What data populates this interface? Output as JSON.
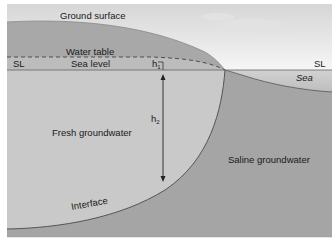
{
  "diagram": {
    "labels": {
      "ground_surface": "Ground surface",
      "water_table": "Water table",
      "sea_level": "Sea level",
      "sl_left": "SL",
      "sl_right": "SL",
      "sea": "Sea",
      "h1_base": "h",
      "h1_sub": "1",
      "h2_base": "h",
      "h2_sub": "2",
      "fresh_groundwater": "Fresh groundwater",
      "saline_groundwater": "Saline groundwater",
      "interface": "Interface"
    },
    "colors": {
      "sky_top": "#d9d9d9",
      "sky_bottom": "#f4f4f4",
      "ground": "#a9a9a9",
      "unsaturated_band": "#b8b8b8",
      "fresh_water": "#c8c8c8",
      "saline_water": "#a3a3a3",
      "sea": "#c4c4c4",
      "lines": "#555555"
    }
  }
}
